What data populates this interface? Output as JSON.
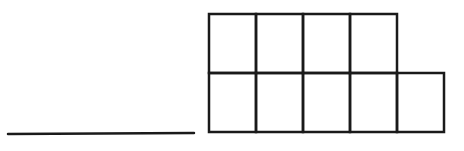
{
  "diagram": {
    "stroke_color": "#1a1a1a",
    "background": "#ffffff",
    "answer_line": {
      "x1": 8,
      "y1": 134,
      "x2": 194,
      "y2": 133
    },
    "grid": {
      "cell_width": 47,
      "cell_height": 59,
      "origin_x": 209,
      "origin_y": 14,
      "rows": [
        {
          "row": 0,
          "cells": 4
        },
        {
          "row": 1,
          "cells": 5
        }
      ],
      "total_cells": 9
    }
  }
}
